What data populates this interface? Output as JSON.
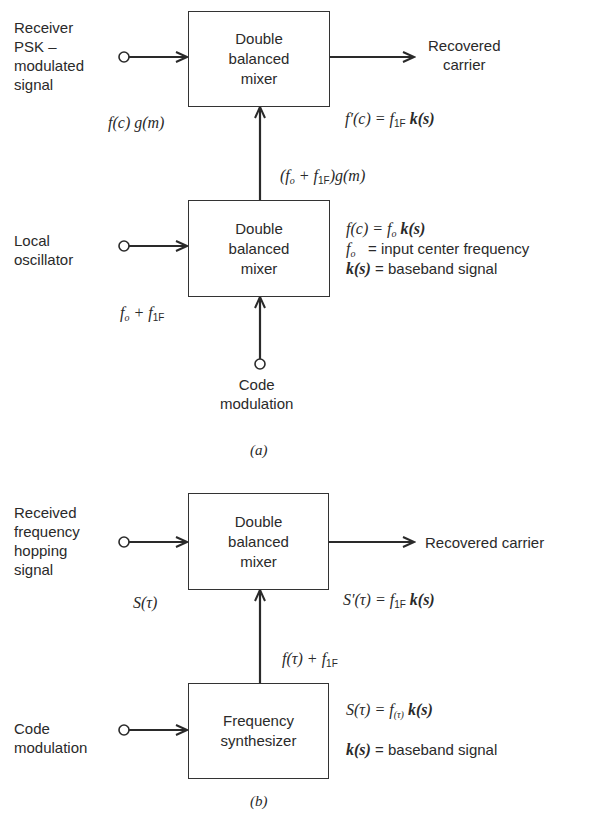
{
  "figure_a": {
    "caption": "(a)",
    "mixer_top": {
      "label": "Double\nbalanced\nmixer"
    },
    "mixer_bottom": {
      "label": "Double\nbalanced\nmixer"
    },
    "input_top_label": "Receiver\nPSK –\nmodulated\nsignal",
    "input_top_expr": {
      "a": "f(c) g(m)"
    },
    "output_label": "Recovered\ncarrier",
    "output_expr": {
      "lhs": "f′(c) = f",
      "sub": "1F",
      "rhs": "k(s)"
    },
    "between_expr": {
      "p1": "(f",
      "sub1": "o",
      "p2": " + f",
      "sub2": "1F",
      "p3": ")g(m)"
    },
    "local_osc_label": "Local\noscillator",
    "local_osc_expr": {
      "p1": "f",
      "sub1": "o",
      "p2": " + f",
      "sub2": "1F"
    },
    "defs": {
      "line1": {
        "lhs": "f(c)",
        "mid": " = f",
        "sub": "o",
        "rhs": "k(s)"
      },
      "line2": {
        "lhs": "f",
        "sub": "o",
        "text": "   = input center frequency"
      },
      "line3": {
        "lhs": "k(s)",
        "text": " = baseband signal"
      }
    },
    "code_mod_label": "Code\nmodulation"
  },
  "figure_b": {
    "caption": "(b)",
    "mixer": {
      "label": "Double\nbalanced\nmixer"
    },
    "synth": {
      "label": "Frequency\nsynthesizer"
    },
    "input_label": "Received\nfrequency\nhopping\nsignal",
    "input_expr": "S(τ)",
    "output_label": "Recovered carrier",
    "output_expr": {
      "lhs": "S′(τ) = f",
      "sub": "1F",
      "rhs": "k(s)"
    },
    "between_expr": {
      "p1": "f(τ) + f",
      "sub": "1F"
    },
    "code_mod_label": "Code\nmodulation",
    "defs": {
      "line1": {
        "lhs": "S(τ) = f",
        "sub": "(τ)",
        "rhs": "k(s)"
      },
      "line2": {
        "lhs": "k(s)",
        "text": " = baseband signal"
      }
    }
  }
}
